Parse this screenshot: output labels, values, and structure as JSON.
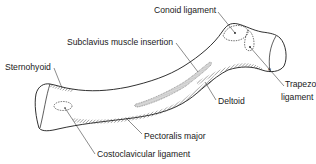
{
  "diagram": {
    "colors": {
      "line": "#1a1a1a",
      "hatch": "#555555",
      "background": "#ffffff"
    },
    "labels": [
      {
        "id": "conoid",
        "text": "Conoid ligament",
        "x": 154,
        "y": 6
      },
      {
        "id": "subclavius",
        "text": "Subclavius muscle insertion",
        "x": 67,
        "y": 38
      },
      {
        "id": "sternohyoid",
        "text": "Sternohyoid",
        "x": 5,
        "y": 63
      },
      {
        "id": "trapezoid_1",
        "text": "Trapezoid",
        "x": 285,
        "y": 80
      },
      {
        "id": "trapezoid_2",
        "text": "ligament",
        "x": 281,
        "y": 93
      },
      {
        "id": "deltoid",
        "text": "Deltoid",
        "x": 218,
        "y": 97
      },
      {
        "id": "pectoralis",
        "text": "Pectoralis major",
        "x": 144,
        "y": 132
      },
      {
        "id": "costoclavicular",
        "text": "Costoclavicular ligament",
        "x": 97,
        "y": 150
      }
    ]
  }
}
